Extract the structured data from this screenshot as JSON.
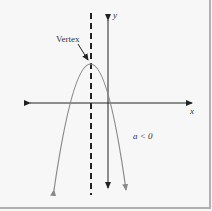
{
  "diagram": {
    "type": "parabola-graph",
    "labels": {
      "vertex": "Vertex",
      "y_axis": "y",
      "x_axis": "x",
      "condition": "a < 0"
    },
    "colors": {
      "background": "#f7f7f7",
      "curve": "#8a8a8a",
      "axes": "#222222",
      "border": "#b0b0b0"
    },
    "elements": {
      "x_axis": {
        "y": 103,
        "x_from": 22,
        "x_to": 195,
        "arrows": "both"
      },
      "y_axis": {
        "x": 108,
        "y_from": 13,
        "y_to": 193,
        "arrows": "both"
      },
      "axis_of_symmetry": {
        "x": 91,
        "y_from": 13,
        "y_to": 195,
        "style": "dashed"
      },
      "vertex_point": {
        "x": 91,
        "y": 64
      },
      "parabola_opens": "down"
    }
  }
}
